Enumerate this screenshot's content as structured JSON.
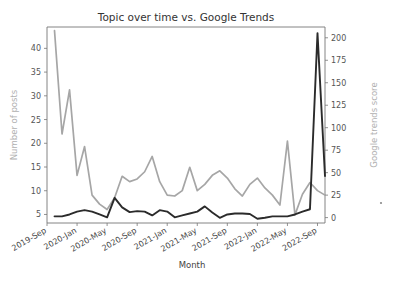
{
  "chart_data": {
    "type": "line",
    "title": "Topic over time vs. Google Trends",
    "xlabel": "Month",
    "ylabel": "Number of posts",
    "ylabel_right": "Google trends score",
    "grid": false,
    "legend": "none",
    "x": [
      "2019-Oct",
      "2019-Nov",
      "2019-Dec",
      "2020-Jan",
      "2020-Feb",
      "2020-Mar",
      "2020-Apr",
      "2020-May",
      "2020-Jun",
      "2020-Jul",
      "2020-Aug",
      "2020-Sep",
      "2020-Oct",
      "2020-Nov",
      "2020-Dec",
      "2021-Jan",
      "2021-Feb",
      "2021-Mar",
      "2021-Apr",
      "2021-May",
      "2021-Jun",
      "2021-Jul",
      "2021-Aug",
      "2021-Sep",
      "2021-Oct",
      "2021-Nov",
      "2021-Dec",
      "2022-Jan",
      "2022-Feb",
      "2022-Mar",
      "2022-Apr",
      "2022-May",
      "2022-Jun",
      "2022-Jul",
      "2022-Aug",
      "2022-Sep",
      "2022-Oct"
    ],
    "xticklabels": [
      "2019-Sep",
      "2020-Jan",
      "2020-May",
      "2020-Sep",
      "2021-Jan",
      "2021-May",
      "2021-Sep",
      "2022-Jan",
      "2022-May",
      "2022-Sep"
    ],
    "xtick_indices": [
      -1,
      3,
      7,
      11,
      15,
      19,
      23,
      27,
      31,
      35
    ],
    "yticks_left": [
      5,
      10,
      15,
      20,
      25,
      30,
      35,
      40
    ],
    "ylim_left": [
      3.2,
      44.5
    ],
    "yticks_right": [
      0,
      25,
      50,
      75,
      100,
      125,
      150,
      175,
      200
    ],
    "ylim_right": [
      -6,
      212
    ],
    "series": [
      {
        "name": "Number of posts",
        "axis": "left",
        "color": "#2b2b2b",
        "values": [
          4.6,
          4.6,
          5.0,
          5.6,
          5.9,
          5.6,
          5.0,
          4.4,
          8.5,
          6.5,
          5.5,
          5.7,
          5.6,
          4.8,
          5.9,
          5.6,
          4.4,
          4.8,
          5.2,
          5.6,
          6.7,
          5.4,
          4.3,
          5.0,
          5.2,
          5.2,
          5.1,
          4.1,
          4.3,
          4.6,
          4.6,
          4.6,
          5.0,
          5.6,
          6.1,
          43.2,
          13.1
        ]
      },
      {
        "name": "Google trends score",
        "axis": "right",
        "color": "#a6a6a6",
        "values": [
          208,
          93,
          142,
          47,
          79,
          25,
          15,
          9,
          22,
          46,
          40,
          43,
          51,
          68,
          40,
          25,
          24,
          30,
          56,
          30,
          37,
          47,
          52,
          44,
          32,
          24,
          37,
          44,
          33,
          25,
          14,
          85,
          3,
          26,
          39,
          30,
          25
        ]
      }
    ],
    "series_black_values_detail": [
      4.6,
      4.6,
      5.0,
      5.6,
      5.9,
      5.6,
      5.0,
      4.4,
      8.5,
      6.5,
      5.5,
      5.7,
      5.6,
      4.8,
      5.9,
      5.6,
      4.4,
      4.8,
      5.2,
      5.6,
      6.7,
      5.4,
      4.3,
      5.0,
      5.2,
      5.2,
      5.1,
      4.1,
      4.3,
      4.6,
      4.6,
      4.6,
      5.0,
      5.6,
      6.1,
      43.2,
      13.1
    ]
  },
  "figure": {
    "title": "Topic over time vs. Google Trends",
    "xlabel": "Month",
    "ylabel_left": "Number of posts",
    "ylabel_right": "Google trends score"
  }
}
